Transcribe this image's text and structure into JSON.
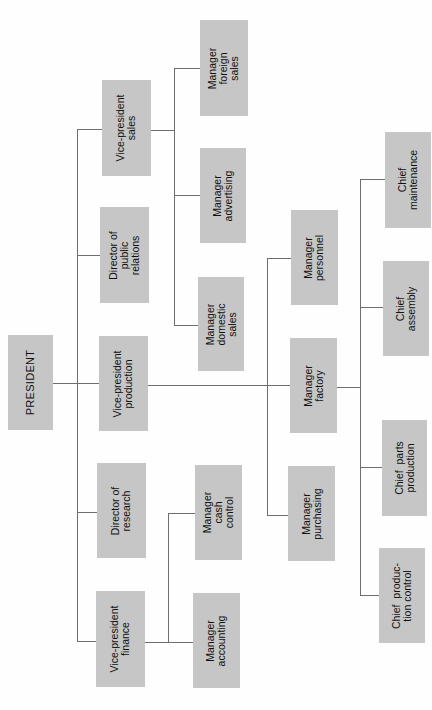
{
  "colors": {
    "box": "#c6c6c6",
    "line": "#6e6e6e",
    "background": "#fefefe",
    "text": "#111111"
  },
  "nodes": {
    "president": "PRESIDENT",
    "vp_sales": "Vice-president\nsales",
    "dir_public_relations": "Director of\npublic\nrelations",
    "vp_production": "Vice-president\nproduction",
    "dir_research": "Director of\nresearch",
    "vp_finance": "Vice-president\nfinance",
    "mgr_foreign_sales": "Manager\nforeign\nsales",
    "mgr_advertising": "Manager\nadvertising",
    "mgr_domestic_sales": "Manager\ndomestic\nsales",
    "mgr_cash_control": "Manager\ncash\ncontrol",
    "mgr_accounting": "Manager\naccounting",
    "mgr_personnel": "Manager\npersonnel",
    "mgr_factory": "Manager\nfactory",
    "mgr_purchasing": "Manager\npurchasing",
    "chief_maintenance": "Chief\nmaintenance",
    "chief_assembly": "Chief\nassembly",
    "chief_parts_production": "Chief  parts\nproduction",
    "chief_production_control": "Chief  produc-\ntion control"
  },
  "hierarchy": {
    "president": [
      "vp_sales",
      "dir_public_relations",
      "vp_production",
      "dir_research",
      "vp_finance"
    ],
    "vp_sales": [
      "mgr_foreign_sales",
      "mgr_advertising",
      "mgr_domestic_sales"
    ],
    "vp_finance": [
      "mgr_cash_control",
      "mgr_accounting"
    ],
    "vp_production": [
      "mgr_personnel",
      "mgr_factory",
      "mgr_purchasing"
    ],
    "mgr_factory": [
      "chief_maintenance",
      "chief_assembly",
      "chief_parts_production",
      "chief_production_control"
    ]
  }
}
